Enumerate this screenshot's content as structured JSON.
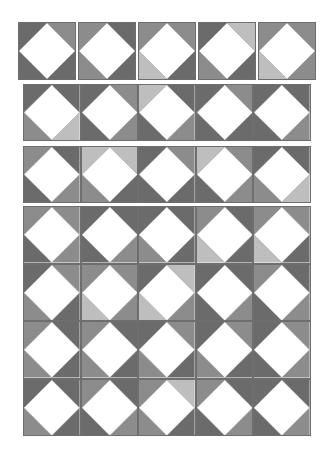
{
  "palette": {
    "D": "#6b6b6b",
    "M": "#8c8c8c",
    "L": "#bebebe",
    "center": "#ffffff",
    "border": "#6e6e6e"
  },
  "corner_order": [
    "top-left",
    "top-right",
    "bottom-left",
    "bottom-right"
  ],
  "rows": {
    "row1": [
      [
        "D",
        "M",
        "D",
        "D"
      ],
      [
        "M",
        "D",
        "M",
        "D"
      ],
      [
        "M",
        "M",
        "L",
        "D"
      ],
      [
        "D",
        "L",
        "M",
        "D"
      ],
      [
        "M",
        "M",
        "L",
        "M"
      ]
    ],
    "row2": [
      [
        "D",
        "D",
        "M",
        "L"
      ],
      [
        "D",
        "M",
        "D",
        "M"
      ],
      [
        "L",
        "D",
        "D",
        "M"
      ],
      [
        "D",
        "M",
        "D",
        "D"
      ],
      [
        "D",
        "D",
        "D",
        "M"
      ]
    ],
    "row3": [
      [
        "M",
        "D",
        "D",
        "M"
      ],
      [
        "L",
        "L",
        "M",
        "D"
      ],
      [
        "D",
        "M",
        "D",
        "D"
      ],
      [
        "L",
        "M",
        "D",
        "M"
      ],
      [
        "D",
        "D",
        "M",
        "L"
      ]
    ]
  },
  "grid": [
    [
      [
        "M",
        "M",
        "D",
        "M"
      ],
      [
        "D",
        "D",
        "D",
        "M"
      ],
      [
        "D",
        "D",
        "M",
        "D"
      ],
      [
        "M",
        "D",
        "L",
        "D"
      ],
      [
        "M",
        "M",
        "L",
        "D"
      ]
    ],
    [
      [
        "D",
        "M",
        "M",
        "D"
      ],
      [
        "M",
        "M",
        "L",
        "M"
      ],
      [
        "D",
        "L",
        "L",
        "M"
      ],
      [
        "D",
        "D",
        "D",
        "M"
      ],
      [
        "M",
        "D",
        "D",
        "M"
      ]
    ],
    [
      [
        "M",
        "D",
        "M",
        "D"
      ],
      [
        "M",
        "D",
        "M",
        "D"
      ],
      [
        "D",
        "M",
        "M",
        "D"
      ],
      [
        "D",
        "M",
        "M",
        "D"
      ],
      [
        "D",
        "M",
        "D",
        "M"
      ]
    ],
    [
      [
        "D",
        "D",
        "M",
        "D"
      ],
      [
        "M",
        "D",
        "D",
        "M"
      ],
      [
        "M",
        "L",
        "M",
        "D"
      ],
      [
        "M",
        "D",
        "D",
        "M"
      ],
      [
        "D",
        "D",
        "D",
        "M"
      ]
    ]
  ]
}
